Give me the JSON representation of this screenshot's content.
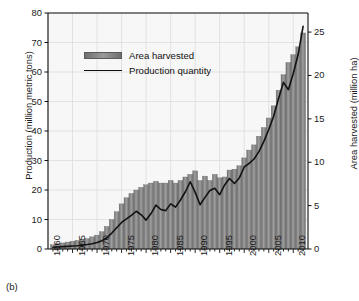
{
  "figure": {
    "caption": "(b)"
  },
  "legend": {
    "position": "top-left-inside",
    "items": [
      {
        "label": "Area harvested",
        "marker": "bar-swatch",
        "color": "#8a8a8a"
      },
      {
        "label": "Production quantity",
        "marker": "line",
        "color": "#111111"
      }
    ]
  },
  "chart_data": {
    "type": "bar",
    "title": "",
    "subtitle": "",
    "xlabel": "",
    "ylabel": "Production (million metric tons)",
    "y2label": "Area harvested (million ha)",
    "grid": true,
    "xlim": [
      1960,
      2013
    ],
    "ylim": [
      0,
      80
    ],
    "y2lim": [
      0,
      27.2
    ],
    "ytick_labels": [
      "0",
      "10",
      "20",
      "30",
      "40",
      "50",
      "60",
      "70",
      "80"
    ],
    "ytick_values": [
      0,
      10,
      20,
      30,
      40,
      50,
      60,
      70,
      80
    ],
    "y2tick_labels": [
      "0",
      "5",
      "10",
      "15",
      "20",
      "25"
    ],
    "y2tick_values": [
      0,
      5,
      10,
      15,
      20,
      25
    ],
    "xtick_labels": [
      "1960",
      "1965",
      "1970",
      "1975",
      "1980",
      "1985",
      "1990",
      "1995",
      "2000",
      "2005",
      "2010"
    ],
    "xtick_values": [
      1960,
      1965,
      1970,
      1975,
      1980,
      1985,
      1990,
      1995,
      2000,
      2005,
      2010
    ],
    "x": [
      1961,
      1962,
      1963,
      1964,
      1965,
      1966,
      1967,
      1968,
      1969,
      1970,
      1971,
      1972,
      1973,
      1974,
      1975,
      1976,
      1977,
      1978,
      1979,
      1980,
      1981,
      1982,
      1983,
      1984,
      1985,
      1986,
      1987,
      1988,
      1989,
      1990,
      1991,
      1992,
      1993,
      1994,
      1995,
      1996,
      1997,
      1998,
      1999,
      2000,
      2001,
      2002,
      2003,
      2004,
      2005,
      2006,
      2007,
      2008,
      2009,
      2010,
      2011,
      2012
    ],
    "series": [
      {
        "name": "Area harvested",
        "axis": "right",
        "unit": "million ha",
        "render": "bar",
        "color": "#8a8a8a",
        "values": [
          0.5,
          0.6,
          0.7,
          0.8,
          0.9,
          1.0,
          1.1,
          1.2,
          1.4,
          1.6,
          2.0,
          2.6,
          3.4,
          4.3,
          5.2,
          5.9,
          6.4,
          6.8,
          7.1,
          7.4,
          7.6,
          7.8,
          7.6,
          7.6,
          7.9,
          7.6,
          7.9,
          8.3,
          8.6,
          9.0,
          7.9,
          8.4,
          7.9,
          8.6,
          8.2,
          8.3,
          9.1,
          9.2,
          9.6,
          10.5,
          11.4,
          12.0,
          13.0,
          14.0,
          15.1,
          16.5,
          18.3,
          20.1,
          21.5,
          22.4,
          23.3,
          24.9
        ]
      },
      {
        "name": "Production quantity",
        "axis": "left",
        "unit": "million metric tons",
        "render": "line",
        "color": "#111111",
        "values": [
          0.6,
          0.7,
          0.8,
          0.9,
          1.0,
          1.1,
          1.3,
          1.5,
          1.8,
          2.2,
          2.8,
          3.8,
          5.4,
          7.2,
          9.0,
          10.2,
          11.4,
          12.8,
          11.6,
          9.8,
          12.0,
          14.9,
          13.4,
          13.0,
          15.3,
          14.2,
          16.6,
          19.4,
          22.8,
          19.2,
          15.0,
          17.5,
          19.8,
          20.6,
          18.4,
          21.7,
          23.9,
          22.2,
          24.1,
          27.8,
          29.0,
          30.5,
          33.0,
          36.5,
          40.5,
          45.0,
          51.0,
          56.5,
          54.0,
          59.5,
          66.0,
          75.5
        ]
      }
    ]
  }
}
